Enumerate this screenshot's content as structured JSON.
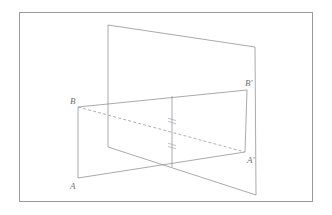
{
  "figure": {
    "background_color": "#ffffff",
    "border": {
      "name": "outer-frame",
      "color": "#9a9a9f",
      "x": 19,
      "y": 12,
      "width": 293,
      "height": 189,
      "stroke_width": 1
    },
    "stroke_colors": {
      "solid": "#8d8d93",
      "dashed": "#9b9ba1",
      "faint": "#a8a8ad",
      "label": "#6e6e72"
    },
    "labels": [
      {
        "id": "label-A",
        "text": "A",
        "x": 70,
        "y": 189
      },
      {
        "id": "label-B",
        "text": "B",
        "x": 70,
        "y": 104
      },
      {
        "id": "label-Ap",
        "text": "A'",
        "x": 247,
        "y": 163
      },
      {
        "id": "label-Bp",
        "text": "B'",
        "x": 245,
        "y": 86
      }
    ],
    "points": {
      "A": {
        "x": 78,
        "y": 178
      },
      "B": {
        "x": 78,
        "y": 107
      },
      "A1": {
        "x": 245,
        "y": 152
      },
      "B1": {
        "x": 247,
        "y": 90
      },
      "V_topleft": {
        "x": 108,
        "y": 25
      },
      "V_topright": {
        "x": 255,
        "y": 47
      },
      "V_bottomleft": {
        "x": 108,
        "y": 147
      },
      "V_bottomright": {
        "x": 256,
        "y": 195
      },
      "mid_top": {
        "x": 172,
        "y": 96
      },
      "mid_bottom": {
        "x": 172,
        "y": 167
      }
    },
    "segments": [
      {
        "name": "vertical-plane-top-edge",
        "style": "solid",
        "from": "V_topleft",
        "to": "V_topright"
      },
      {
        "name": "vertical-plane-left-edge",
        "style": "solid",
        "from": "V_topleft",
        "to": "V_bottomleft"
      },
      {
        "name": "vertical-plane-right-edge",
        "style": "solid",
        "from": "V_topright",
        "to": "V_bottomright"
      },
      {
        "name": "vertical-plane-bottom-edge",
        "style": "solid",
        "from": "V_bottomleft",
        "to": "V_bottomright"
      },
      {
        "name": "horizontal-plane-edge-BB1",
        "style": "solid",
        "from": "B",
        "to": "B1"
      },
      {
        "name": "horizontal-plane-edge-AA1",
        "style": "solid",
        "from": "A",
        "to": "A1"
      },
      {
        "name": "horizontal-plane-edge-AB",
        "style": "solid",
        "from": "A",
        "to": "B"
      },
      {
        "name": "horizontal-plane-edge-A1B1",
        "style": "solid",
        "from": "A1",
        "to": "B1"
      },
      {
        "name": "diagonal-B-to-A1",
        "style": "dashed",
        "from": "B",
        "to": "A1"
      },
      {
        "name": "center-vertical-axis",
        "style": "solid",
        "from": "mid_top",
        "to": "mid_bottom"
      }
    ],
    "tick_marks": [
      {
        "name": "tick-upper",
        "x": 172,
        "y": 121,
        "half_width": 4
      },
      {
        "name": "tick-lower",
        "x": 172,
        "y": 146,
        "half_width": 4
      }
    ],
    "notes": {
      "shape_description": "Two intersecting planes: an upright quadrilateral plane and a horizontal parallelogram ABB'A'",
      "dashed_line_meaning": "hidden diagonal from B to A'",
      "tick_meaning": "equal-length congruence marks on the central vertical segment"
    }
  }
}
